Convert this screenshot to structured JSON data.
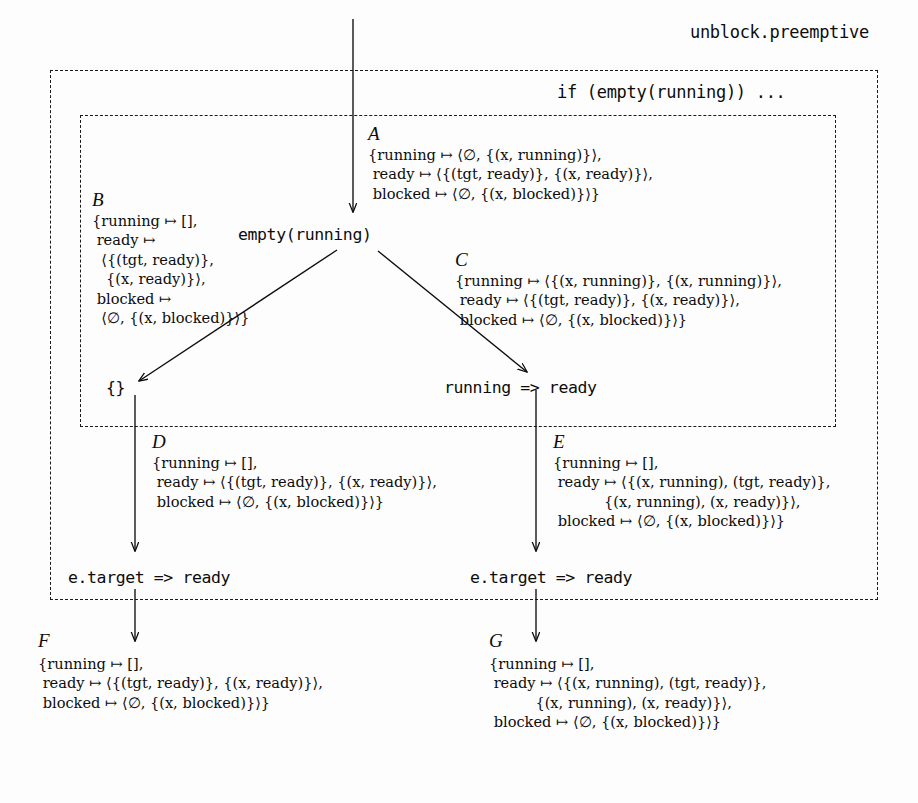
{
  "diagram": {
    "title": "unblock.preemptive",
    "outer_box_label": "unblock.preemptive",
    "inner_box_label": "if (empty(running)) ...",
    "nodes": {
      "entry_condition": "empty(running)",
      "left_result": "{}",
      "right_result": "running => ready",
      "left_action": "e.target => ready",
      "right_action": "e.target => ready"
    },
    "states": {
      "A": {
        "label": "A",
        "lines": [
          "{running ↦ ⟨∅, {(x, running)}⟩,",
          " ready ↦ ⟨{(tgt, ready)}, {(x, ready)}⟩,",
          " blocked ↦ ⟨∅, {(x, blocked)}⟩}"
        ]
      },
      "B": {
        "label": "B",
        "lines": [
          "{running ↦ [],",
          " ready ↦",
          "  ⟨{(tgt, ready)},",
          "   {(x, ready)}⟩,",
          " blocked ↦",
          "  ⟨∅, {(x, blocked)}⟩}"
        ]
      },
      "C": {
        "label": "C",
        "lines": [
          "{running ↦ ⟨{(x, running)}, {(x, running)}⟩,",
          " ready ↦ ⟨{(tgt, ready)}, {(x, ready)}⟩,",
          " blocked ↦ ⟨∅, {(x, blocked)}⟩}"
        ]
      },
      "D": {
        "label": "D",
        "lines": [
          "{running ↦ [],",
          " ready ↦ ⟨{(tgt, ready)}, {(x, ready)}⟩,",
          " blocked ↦ ⟨∅, {(x, blocked)}⟩}"
        ]
      },
      "E": {
        "label": "E",
        "lines": [
          "{running ↦ [],",
          " ready ↦ ⟨{(x, running), (tgt, ready)},",
          "           {(x, running), (x, ready)}⟩,",
          " blocked ↦ ⟨∅, {(x, blocked)}⟩}"
        ]
      },
      "F": {
        "label": "F",
        "lines": [
          "{running ↦ [],",
          " ready ↦ ⟨{(tgt, ready)}, {(x, ready)}⟩,",
          " blocked ↦ ⟨∅, {(x, blocked)}⟩}"
        ]
      },
      "G": {
        "label": "G",
        "lines": [
          "{running ↦ [],",
          " ready ↦ ⟨{(x, running), (tgt, ready)},",
          "          {(x, running), (x, ready)}⟩,",
          " blocked ↦ ⟨∅, {(x, blocked)}⟩}"
        ]
      }
    },
    "colors": {
      "ink": "#0c0c0c",
      "paper": "#fdfdfd",
      "dash": "#1a1a1a"
    }
  }
}
